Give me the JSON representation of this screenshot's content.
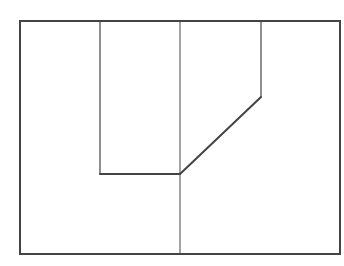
{
  "diagram": {
    "width": 344,
    "height": 266,
    "background": "#ffffff",
    "stroke_color": "#444444",
    "outer_rect": {
      "x": 20,
      "y": 21,
      "width": 320,
      "height": 233,
      "stroke_width": 2
    },
    "lines": [
      {
        "name": "left-inner-vertical",
        "x1": 100,
        "y1": 21,
        "x2": 100,
        "y2": 174,
        "stroke_width": 1.2
      },
      {
        "name": "center-vertical",
        "x1": 180,
        "y1": 21,
        "x2": 180,
        "y2": 254,
        "stroke_width": 1
      },
      {
        "name": "right-inner-vertical",
        "x1": 261,
        "y1": 21,
        "x2": 261,
        "y2": 97,
        "stroke_width": 1.2
      },
      {
        "name": "bottom-horizontal-segment",
        "x1": 100,
        "y1": 174,
        "x2": 180,
        "y2": 174,
        "stroke_width": 2
      },
      {
        "name": "diagonal-segment",
        "x1": 180,
        "y1": 174,
        "x2": 261,
        "y2": 97,
        "stroke_width": 2
      }
    ]
  }
}
